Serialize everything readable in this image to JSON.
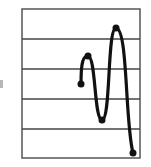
{
  "diagram": {
    "frame": {
      "x": 22,
      "y": 9,
      "width": 118,
      "height": 149,
      "stroke": "#555555"
    },
    "gridlines_y": [
      39,
      69,
      99,
      129
    ],
    "gridline_color": "#444444",
    "curve_color": "#111111",
    "points": [
      {
        "x": 81,
        "y": 84,
        "label": "start"
      },
      {
        "x": 88,
        "y": 56,
        "label": "peak-1"
      },
      {
        "x": 102,
        "y": 120,
        "label": "trough"
      },
      {
        "x": 116,
        "y": 28,
        "label": "peak-2"
      },
      {
        "x": 133,
        "y": 153,
        "label": "end"
      }
    ]
  }
}
